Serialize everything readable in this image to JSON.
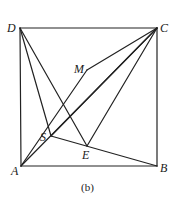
{
  "diagram": {
    "caption": "(b)",
    "stroke_color": "#222222",
    "points": {
      "A": {
        "label": "A",
        "x": 21,
        "y": 166,
        "lx": 11,
        "ly": 175
      },
      "B": {
        "label": "B",
        "x": 157,
        "y": 166,
        "lx": 160,
        "ly": 172
      },
      "C": {
        "label": "C",
        "x": 157,
        "y": 28,
        "lx": 160,
        "ly": 32
      },
      "D": {
        "label": "D",
        "x": 20,
        "y": 28,
        "lx": 7,
        "ly": 32
      },
      "M": {
        "label": "M",
        "x": 87,
        "y": 70,
        "lx": 74,
        "ly": 73
      },
      "S": {
        "label": "S",
        "x": 51,
        "y": 136,
        "lx": 40,
        "ly": 141
      },
      "E": {
        "label": "E",
        "x": 87,
        "y": 146,
        "lx": 82,
        "ly": 159
      }
    },
    "segments": [
      [
        "A",
        "B"
      ],
      [
        "B",
        "C"
      ],
      [
        "C",
        "D"
      ],
      [
        "D",
        "A"
      ],
      [
        "A",
        "M"
      ],
      [
        "M",
        "C"
      ],
      [
        "A",
        "C"
      ],
      [
        "D",
        "S"
      ],
      [
        "D",
        "E"
      ],
      [
        "S",
        "B"
      ],
      [
        "S",
        "C"
      ],
      [
        "E",
        "C"
      ]
    ]
  }
}
